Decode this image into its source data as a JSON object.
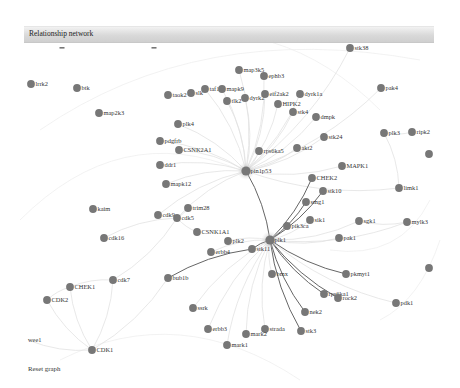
{
  "window": {
    "title": "Relationship network"
  },
  "controls": {
    "reset_label": "Reset graph"
  },
  "colors": {
    "node": "#777777",
    "hub_halo": "#bbbbbb",
    "edge_light": "#e2e2e2",
    "edge_dark": "#666666",
    "header_top": "#f2f2f2",
    "header_bottom": "#cfcfcf"
  },
  "nodes": [
    {
      "id": "lrrk2",
      "label": "lrrk2",
      "x": 31,
      "y": 84
    },
    {
      "id": "btk",
      "label": "btk",
      "x": 77,
      "y": 88
    },
    {
      "id": "map2k3",
      "label": "map2k3",
      "x": 99,
      "y": 113
    },
    {
      "id": "taok2",
      "label": "taok2",
      "x": 168,
      "y": 95
    },
    {
      "id": "slk",
      "label": "slk",
      "x": 191,
      "y": 93
    },
    {
      "id": "taf1",
      "label": "taf1",
      "x": 205,
      "y": 89
    },
    {
      "id": "mapk9",
      "label": "mapk9",
      "x": 222,
      "y": 89
    },
    {
      "id": "map3k5",
      "label": "map3k5",
      "x": 239,
      "y": 70
    },
    {
      "id": "ephb3",
      "label": "ephb3",
      "x": 264,
      "y": 76
    },
    {
      "id": "tlk2",
      "label": "tlk2",
      "x": 227,
      "y": 101
    },
    {
      "id": "dyrk2",
      "label": "dyrk2",
      "x": 245,
      "y": 98
    },
    {
      "id": "eif2ak2",
      "label": "eif2ak2",
      "x": 265,
      "y": 94
    },
    {
      "id": "dyrk1a",
      "label": "dyrk1a",
      "x": 300,
      "y": 94
    },
    {
      "id": "HIPK2",
      "label": "HIPK2",
      "x": 278,
      "y": 104
    },
    {
      "id": "stk4",
      "label": "stk4",
      "x": 293,
      "y": 112
    },
    {
      "id": "dmpk",
      "label": "dmpk",
      "x": 316,
      "y": 117
    },
    {
      "id": "stk38",
      "label": "stk38",
      "x": 350,
      "y": 48
    },
    {
      "id": "pak4",
      "label": "pak4",
      "x": 381,
      "y": 88
    },
    {
      "id": "plk4",
      "label": "plk4",
      "x": 178,
      "y": 124
    },
    {
      "id": "pdgfrb",
      "label": "pdgfrb",
      "x": 160,
      "y": 141
    },
    {
      "id": "CSNK2A1",
      "label": "CSNK2A1",
      "x": 179,
      "y": 150
    },
    {
      "id": "ddr1",
      "label": "ddr1",
      "x": 160,
      "y": 165
    },
    {
      "id": "mapk12",
      "label": "mapk12",
      "x": 166,
      "y": 184
    },
    {
      "id": "pin1p53",
      "label": "pin1p53",
      "x": 246,
      "y": 171,
      "hub": true
    },
    {
      "id": "rps6ka5",
      "label": "rps6ka5",
      "x": 259,
      "y": 151
    },
    {
      "id": "akt2",
      "label": "akt2",
      "x": 297,
      "y": 148
    },
    {
      "id": "stk24",
      "label": "stk24",
      "x": 324,
      "y": 137
    },
    {
      "id": "plk3",
      "label": "plk3",
      "x": 384,
      "y": 133
    },
    {
      "id": "ripk2",
      "label": "ripk2",
      "x": 412,
      "y": 132
    },
    {
      "id": "partial_r1",
      "label": "",
      "x": 429,
      "y": 154
    },
    {
      "id": "MAPK1",
      "label": "MAPK1",
      "x": 342,
      "y": 166
    },
    {
      "id": "CHEK2",
      "label": "CHEK2",
      "x": 312,
      "y": 178
    },
    {
      "id": "stk10",
      "label": "stk10",
      "x": 323,
      "y": 191
    },
    {
      "id": "smg1",
      "label": "smg1",
      "x": 306,
      "y": 202
    },
    {
      "id": "limk1",
      "label": "limk1",
      "x": 399,
      "y": 188
    },
    {
      "id": "kaim",
      "label": "kaim",
      "x": 93,
      "y": 209
    },
    {
      "id": "trim28",
      "label": "trim28",
      "x": 188,
      "y": 208
    },
    {
      "id": "cdk9",
      "label": "cdk9",
      "x": 158,
      "y": 215
    },
    {
      "id": "cdk5",
      "label": "cdk5",
      "x": 177,
      "y": 218
    },
    {
      "id": "CSNK1A1",
      "label": "CSNK1A1",
      "x": 197,
      "y": 232
    },
    {
      "id": "pik3ca",
      "label": "pik3ca",
      "x": 287,
      "y": 226
    },
    {
      "id": "sik1",
      "label": "sik1",
      "x": 310,
      "y": 220
    },
    {
      "id": "sgk1",
      "label": "sgk1",
      "x": 359,
      "y": 221
    },
    {
      "id": "mylk3",
      "label": "mylk3",
      "x": 407,
      "y": 222
    },
    {
      "id": "cdk16",
      "label": "cdk16",
      "x": 104,
      "y": 238
    },
    {
      "id": "plk2",
      "label": "plk2",
      "x": 228,
      "y": 241
    },
    {
      "id": "plk1",
      "label": "plk1",
      "x": 270,
      "y": 240,
      "hub": true
    },
    {
      "id": "pak1",
      "label": "pak1",
      "x": 339,
      "y": 238
    },
    {
      "id": "erbb4",
      "label": "erbb4",
      "x": 211,
      "y": 252
    },
    {
      "id": "stk11",
      "label": "stk11",
      "x": 252,
      "y": 249
    },
    {
      "id": "partial_r2",
      "label": "",
      "x": 429,
      "y": 268
    },
    {
      "id": "bub1b",
      "label": "bub1b",
      "x": 168,
      "y": 278
    },
    {
      "id": "cdk7",
      "label": "cdk7",
      "x": 113,
      "y": 280
    },
    {
      "id": "CHEK1",
      "label": "CHEK1",
      "x": 70,
      "y": 287
    },
    {
      "id": "bmx",
      "label": "bmx",
      "x": 272,
      "y": 274
    },
    {
      "id": "pkmyt1",
      "label": "pkmyt1",
      "x": 346,
      "y": 274
    },
    {
      "id": "CDK2",
      "label": "CDK2",
      "x": 47,
      "y": 300
    },
    {
      "id": "rps6ka1",
      "label": "rps6ka1",
      "x": 324,
      "y": 294
    },
    {
      "id": "rock2",
      "label": "rock2",
      "x": 338,
      "y": 298
    },
    {
      "id": "pdk1",
      "label": "pdk1",
      "x": 396,
      "y": 303
    },
    {
      "id": "nek2",
      "label": "nek2",
      "x": 305,
      "y": 312
    },
    {
      "id": "ssrk",
      "label": "ssrk",
      "x": 193,
      "y": 308
    },
    {
      "id": "erbb3",
      "label": "erbb3",
      "x": 208,
      "y": 329
    },
    {
      "id": "strada",
      "label": "strada",
      "x": 265,
      "y": 329
    },
    {
      "id": "mark2",
      "label": "mark2",
      "x": 246,
      "y": 334
    },
    {
      "id": "stk3",
      "label": "stk3",
      "x": 301,
      "y": 331
    },
    {
      "id": "mark1",
      "label": "mark1",
      "x": 227,
      "y": 345
    },
    {
      "id": "wee1",
      "label": "wee1",
      "x": 28,
      "y": 340,
      "nodot": true
    },
    {
      "id": "CDK1",
      "label": "CDK1",
      "x": 92,
      "y": 350
    }
  ],
  "edges_dark": [
    [
      "plk1",
      "pin1p53"
    ],
    [
      "plk1",
      "CHEK2"
    ],
    [
      "plk1",
      "stk10"
    ],
    [
      "plk1",
      "smg1"
    ],
    [
      "plk1",
      "pkmyt1"
    ],
    [
      "plk1",
      "rps6ka1"
    ],
    [
      "plk1",
      "rock2"
    ],
    [
      "plk1",
      "nek2"
    ],
    [
      "plk1",
      "stk3"
    ],
    [
      "stk11",
      "bub1b"
    ],
    [
      "plk1",
      "stk11"
    ]
  ],
  "edges_light": [
    [
      "pin1p53",
      "map3k5"
    ],
    [
      "pin1p53",
      "ephb3"
    ],
    [
      "pin1p53",
      "eif2ak2"
    ],
    [
      "pin1p53",
      "HIPK2"
    ],
    [
      "pin1p53",
      "dyrk2"
    ],
    [
      "pin1p53",
      "tlk2"
    ],
    [
      "pin1p53",
      "mapk9"
    ],
    [
      "pin1p53",
      "taf1"
    ],
    [
      "pin1p53",
      "plk4"
    ],
    [
      "pin1p53",
      "CSNK2A1"
    ],
    [
      "pin1p53",
      "pdgfrb"
    ],
    [
      "pin1p53",
      "ddr1"
    ],
    [
      "pin1p53",
      "mapk12"
    ],
    [
      "pin1p53",
      "rps6ka5"
    ],
    [
      "pin1p53",
      "akt2"
    ],
    [
      "pin1p53",
      "stk24"
    ],
    [
      "pin1p53",
      "MAPK1"
    ],
    [
      "pin1p53",
      "stk4"
    ],
    [
      "pin1p53",
      "dmpk"
    ],
    [
      "pin1p53",
      "dyrk1a"
    ],
    [
      "pin1p53",
      "cdk5"
    ],
    [
      "pin1p53",
      "cdk9"
    ],
    [
      "pin1p53",
      "limk1"
    ],
    [
      "pin1p53",
      "stk38"
    ],
    [
      "pin1p53",
      "pak4"
    ],
    [
      "cdk5",
      "cdk16"
    ],
    [
      "cdk5",
      "CSNK1A1"
    ],
    [
      "cdk5",
      "trim28"
    ],
    [
      "cdk7",
      "CHEK1"
    ],
    [
      "cdk7",
      "cdk5"
    ],
    [
      "CHEK1",
      "CDK1"
    ],
    [
      "CDK2",
      "CDK1"
    ],
    [
      "CHEK1",
      "CDK2"
    ],
    [
      "wee1",
      "CDK1"
    ],
    [
      "CDK1",
      "cdk7"
    ],
    [
      "plk1",
      "sgk1"
    ],
    [
      "plk1",
      "pak1"
    ],
    [
      "plk1",
      "pik3ca"
    ],
    [
      "plk1",
      "sik1"
    ],
    [
      "plk1",
      "bmx"
    ],
    [
      "plk1",
      "pdk1"
    ],
    [
      "plk1",
      "mylk3"
    ],
    [
      "plk1",
      "mark2"
    ],
    [
      "plk1",
      "mark1"
    ],
    [
      "plk1",
      "strada"
    ],
    [
      "plk1",
      "ssrk"
    ],
    [
      "plk1",
      "erbb3"
    ],
    [
      "plk1",
      "plk2"
    ],
    [
      "plk1",
      "erbb4"
    ],
    [
      "sgk1",
      "mylk3"
    ],
    [
      "plk3",
      "ripk2"
    ],
    [
      "limk1",
      "plk3"
    ],
    [
      "CDK1",
      "bub1b"
    ]
  ]
}
